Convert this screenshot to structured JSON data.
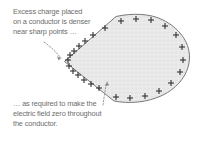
{
  "figure": {
    "name": "charged-conductor-diagram",
    "background_color": "#ffffff",
    "text_color": "#6d6d6d"
  },
  "captions": {
    "top": {
      "lines": [
        "Excess charge placed",
        "on a conductor is denser",
        "near sharp points …"
      ]
    },
    "bottom": {
      "lines": [
        "… as required to make the",
        "electric field zero throughout",
        "the conductor."
      ]
    }
  },
  "conductor": {
    "shape_label": "teardrop-conductor",
    "fill_color": "#e9e9e9",
    "stroke_color": "#6b6b6b",
    "charge_symbol": "+",
    "charge_count": 30,
    "description": "Teardrop shaped conductor with a sharp point at the left and a rounded bulge at the right; plus charges are crowded near the sharp point and spread out along the rounded side."
  },
  "annotations": {
    "pointer_top": {
      "label": "dotted-arrow-to-sharp-point",
      "style": "dotted-curve-with-arrowhead"
    },
    "pointer_bottom": {
      "label": "dotted-arrow-to-conductor-interior",
      "style": "dotted-curve-with-arrowhead"
    }
  },
  "charges": [
    {
      "x": 121,
      "y": 20,
      "r": 0
    },
    {
      "x": 136,
      "y": 18,
      "r": 0
    },
    {
      "x": 151,
      "y": 19,
      "r": 0
    },
    {
      "x": 164,
      "y": 24,
      "r": 0
    },
    {
      "x": 175,
      "y": 32,
      "r": 0
    },
    {
      "x": 182,
      "y": 44,
      "r": 0
    },
    {
      "x": 184,
      "y": 57,
      "r": 0
    },
    {
      "x": 181,
      "y": 70,
      "r": 0
    },
    {
      "x": 173,
      "y": 81,
      "r": 0
    },
    {
      "x": 161,
      "y": 90,
      "r": 0
    },
    {
      "x": 147,
      "y": 96,
      "r": 0
    },
    {
      "x": 132,
      "y": 98,
      "r": 0
    },
    {
      "x": 118,
      "y": 97,
      "r": 0
    },
    {
      "x": 106,
      "y": 93,
      "r": 0
    },
    {
      "x": 105,
      "y": 26,
      "r": 0
    },
    {
      "x": 93,
      "y": 33,
      "r": 0
    },
    {
      "x": 85,
      "y": 39,
      "r": 0
    },
    {
      "x": 79,
      "y": 44,
      "r": 0
    },
    {
      "x": 74,
      "y": 48,
      "r": 0
    },
    {
      "x": 70,
      "y": 52,
      "r": 0
    },
    {
      "x": 67,
      "y": 56,
      "r": 0
    },
    {
      "x": 66,
      "y": 61,
      "r": 0
    },
    {
      "x": 68,
      "y": 66,
      "r": 0
    },
    {
      "x": 72,
      "y": 70,
      "r": 0
    },
    {
      "x": 77,
      "y": 74,
      "r": 0
    },
    {
      "x": 83,
      "y": 78,
      "r": 0
    },
    {
      "x": 90,
      "y": 82,
      "r": 0
    },
    {
      "x": 97,
      "y": 87,
      "r": 0
    }
  ]
}
